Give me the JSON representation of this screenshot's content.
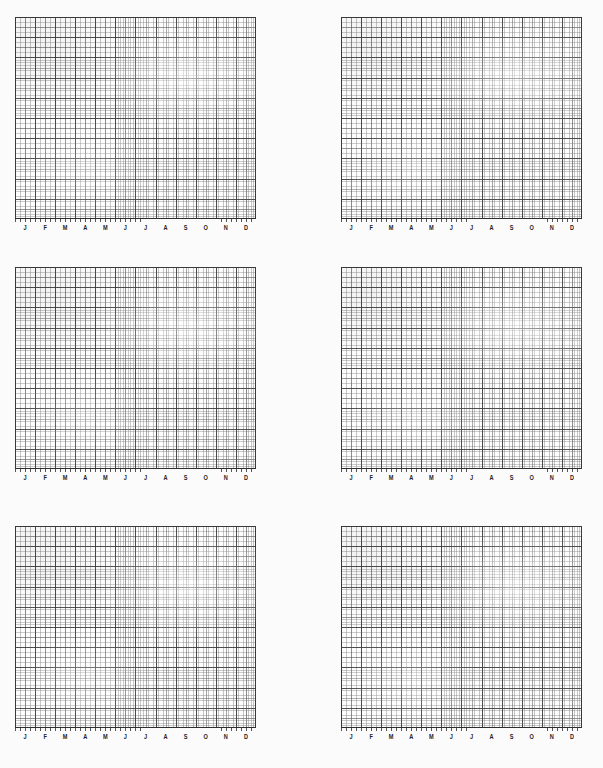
{
  "page": {
    "background_color": "#fbfbfb",
    "paper_color": "#fdfdfd",
    "grid_line_color": "#3c3c3c",
    "label_color": "#1d1d1d",
    "columns": 2,
    "rows": 3,
    "panel_count": 6
  },
  "chart_data": [
    {
      "type": "line",
      "title": "",
      "subtitle": "",
      "xlabel": "",
      "ylabel": "",
      "categories": [
        "J",
        "F",
        "M",
        "A",
        "M",
        "J",
        "J",
        "A",
        "S",
        "O",
        "N",
        "D"
      ],
      "tick_labels": [
        "J",
        "F",
        "M",
        "A",
        "M",
        "J",
        "J",
        "A",
        "S",
        "O",
        "N",
        "D"
      ],
      "series": [],
      "values": [],
      "grid": true,
      "grid_minor": true,
      "legend": false,
      "legend_position": "none",
      "annotations": [],
      "ylim": [
        0,
        0
      ],
      "note": "empty grid - no plotted data"
    },
    {
      "type": "line",
      "title": "",
      "subtitle": "",
      "xlabel": "",
      "ylabel": "",
      "categories": [
        "J",
        "F",
        "M",
        "A",
        "M",
        "J",
        "J",
        "A",
        "S",
        "O",
        "N",
        "D"
      ],
      "tick_labels": [
        "J",
        "F",
        "M",
        "A",
        "M",
        "J",
        "J",
        "A",
        "S",
        "O",
        "N",
        "D"
      ],
      "series": [],
      "values": [],
      "grid": true,
      "grid_minor": true,
      "legend": false,
      "legend_position": "none",
      "annotations": [],
      "ylim": [
        0,
        0
      ],
      "note": "empty grid - no plotted data"
    },
    {
      "type": "line",
      "title": "",
      "subtitle": "",
      "xlabel": "",
      "ylabel": "",
      "categories": [
        "J",
        "F",
        "M",
        "A",
        "M",
        "J",
        "J",
        "A",
        "S",
        "O",
        "N",
        "D"
      ],
      "tick_labels": [
        "J",
        "F",
        "M",
        "A",
        "M",
        "J",
        "J",
        "A",
        "S",
        "O",
        "N",
        "D"
      ],
      "series": [],
      "values": [],
      "grid": true,
      "grid_minor": true,
      "legend": false,
      "legend_position": "none",
      "annotations": [],
      "ylim": [
        0,
        0
      ],
      "note": "empty grid - no plotted data"
    },
    {
      "type": "line",
      "title": "",
      "subtitle": "",
      "xlabel": "",
      "ylabel": "",
      "categories": [
        "J",
        "F",
        "M",
        "A",
        "M",
        "J",
        "J",
        "A",
        "S",
        "O",
        "N",
        "D"
      ],
      "tick_labels": [
        "J",
        "F",
        "M",
        "A",
        "M",
        "J",
        "J",
        "A",
        "S",
        "O",
        "N",
        "D"
      ],
      "series": [],
      "values": [],
      "grid": true,
      "grid_minor": true,
      "legend": false,
      "legend_position": "none",
      "annotations": [],
      "ylim": [
        0,
        0
      ],
      "note": "empty grid - no plotted data"
    },
    {
      "type": "line",
      "title": "",
      "subtitle": "",
      "xlabel": "",
      "ylabel": "",
      "categories": [
        "J",
        "F",
        "M",
        "A",
        "M",
        "J",
        "J",
        "A",
        "S",
        "O",
        "N",
        "D"
      ],
      "tick_labels": [
        "J",
        "F",
        "M",
        "A",
        "M",
        "J",
        "J",
        "A",
        "S",
        "O",
        "N",
        "D"
      ],
      "series": [],
      "values": [],
      "grid": true,
      "grid_minor": true,
      "legend": false,
      "legend_position": "none",
      "annotations": [],
      "ylim": [
        0,
        0
      ],
      "note": "empty grid - no plotted data"
    },
    {
      "type": "line",
      "title": "",
      "subtitle": "",
      "xlabel": "",
      "ylabel": "",
      "categories": [
        "J",
        "F",
        "M",
        "A",
        "M",
        "J",
        "J",
        "A",
        "S",
        "O",
        "N",
        "D"
      ],
      "tick_labels": [
        "J",
        "F",
        "M",
        "A",
        "M",
        "J",
        "J",
        "A",
        "S",
        "O",
        "N",
        "D"
      ],
      "series": [],
      "values": [],
      "grid": true,
      "grid_minor": true,
      "legend": false,
      "legend_position": "none",
      "annotations": [],
      "ylim": [
        0,
        0
      ],
      "note": "empty grid - no plotted data"
    }
  ],
  "panels": [
    {
      "id": "panel-1",
      "position": "top-left",
      "months": [
        "J",
        "F",
        "M",
        "A",
        "M",
        "J",
        "J",
        "A",
        "S",
        "O",
        "N",
        "D"
      ]
    },
    {
      "id": "panel-2",
      "position": "top-right",
      "months": [
        "J",
        "F",
        "M",
        "A",
        "M",
        "J",
        "J",
        "A",
        "S",
        "O",
        "N",
        "D"
      ]
    },
    {
      "id": "panel-3",
      "position": "middle-left",
      "months": [
        "J",
        "F",
        "M",
        "A",
        "M",
        "J",
        "J",
        "A",
        "S",
        "O",
        "N",
        "D"
      ]
    },
    {
      "id": "panel-4",
      "position": "middle-right",
      "months": [
        "J",
        "F",
        "M",
        "A",
        "M",
        "J",
        "J",
        "A",
        "S",
        "O",
        "N",
        "D"
      ]
    },
    {
      "id": "panel-5",
      "position": "bottom-left",
      "months": [
        "J",
        "F",
        "M",
        "A",
        "M",
        "J",
        "J",
        "A",
        "S",
        "O",
        "N",
        "D"
      ]
    },
    {
      "id": "panel-6",
      "position": "bottom-right",
      "months": [
        "J",
        "F",
        "M",
        "A",
        "M",
        "J",
        "J",
        "A",
        "S",
        "O",
        "N",
        "D"
      ]
    }
  ]
}
